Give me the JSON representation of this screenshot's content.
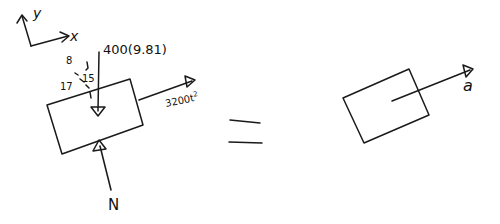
{
  "diagram": {
    "type": "free-body-diagram",
    "axes": {
      "x_label": "x",
      "y_label": "y"
    },
    "left": {
      "weight_label": "400(9.81)",
      "force_label": "3200t",
      "force_exponent": "2",
      "normal_label": "N",
      "slope": {
        "rise": "8",
        "hyp": "17",
        "run": "15"
      }
    },
    "equals": "=",
    "right": {
      "accel_label": "a"
    }
  },
  "colors": {
    "ink": "#1a1a1a",
    "background": "#ffffff"
  }
}
